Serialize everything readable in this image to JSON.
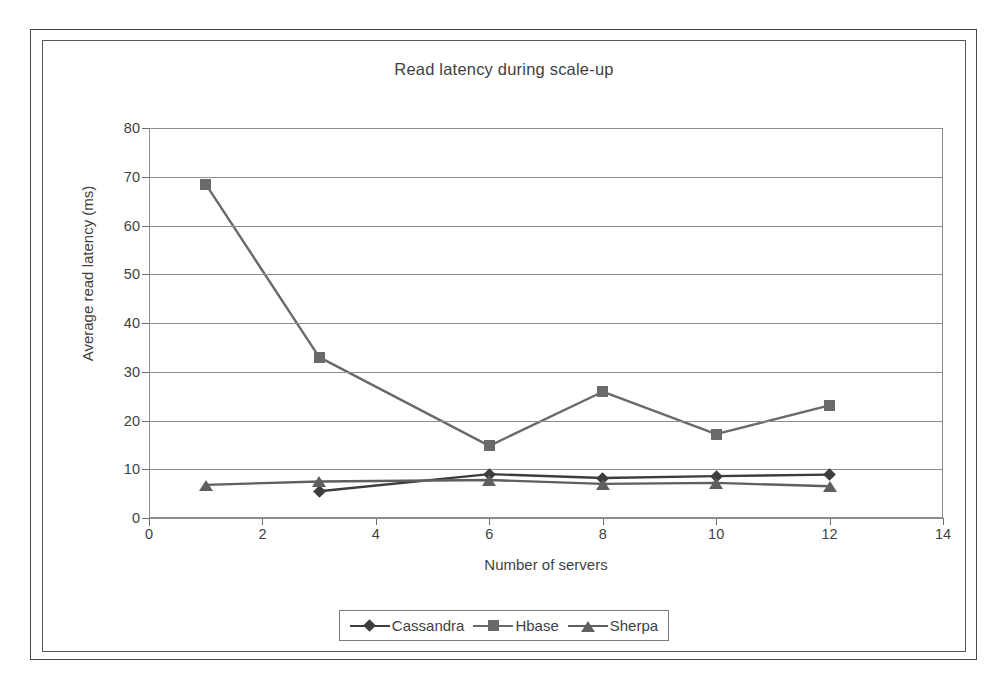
{
  "chart_data": {
    "type": "line",
    "title": "Read latency during scale-up",
    "xlabel": "Number of servers",
    "ylabel": "Average read latency (ms)",
    "xlim": [
      0,
      14
    ],
    "ylim": [
      0,
      80
    ],
    "xticks": [
      0,
      2,
      4,
      6,
      8,
      10,
      12,
      14
    ],
    "yticks": [
      0,
      10,
      20,
      30,
      40,
      50,
      60,
      70,
      80
    ],
    "grid": "horizontal",
    "legend_position": "bottom",
    "series": [
      {
        "name": "Cassandra",
        "marker": "diamond",
        "color": "#3d3d3d",
        "x": [
          3,
          6,
          8,
          10,
          12
        ],
        "values": [
          5.5,
          9.0,
          8.2,
          8.6,
          8.9
        ]
      },
      {
        "name": "Hbase",
        "marker": "square",
        "color": "#6a6a6a",
        "x": [
          1,
          3,
          6,
          8,
          10,
          12
        ],
        "values": [
          68.5,
          33.0,
          14.8,
          25.9,
          17.2,
          23.1
        ]
      },
      {
        "name": "Sherpa",
        "marker": "triangle",
        "color": "#5f5f5f",
        "x": [
          1,
          3,
          6,
          8,
          10,
          12
        ],
        "values": [
          6.8,
          7.5,
          7.8,
          7.0,
          7.2,
          6.5
        ]
      }
    ]
  },
  "chart": {
    "title": "Read latency during scale-up",
    "x_axis_title": "Number of servers",
    "y_axis_title": "Average read latency (ms)",
    "x_tick_labels": [
      "0",
      "2",
      "4",
      "6",
      "8",
      "10",
      "12",
      "14"
    ],
    "y_tick_labels": [
      "0",
      "10",
      "20",
      "30",
      "40",
      "50",
      "60",
      "70",
      "80"
    ]
  },
  "legend": {
    "items": [
      {
        "label": "Cassandra"
      },
      {
        "label": "Hbase"
      },
      {
        "label": "Sherpa"
      }
    ]
  },
  "colors": {
    "grid": "#8d8d8d",
    "axis": "#6f6f6f",
    "text": "#3f3f3f",
    "cassandra": "#3d3d3d",
    "hbase": "#6a6a6a",
    "sherpa": "#5f5f5f",
    "frame": "#4a4a4a",
    "background": "#ffffff"
  }
}
